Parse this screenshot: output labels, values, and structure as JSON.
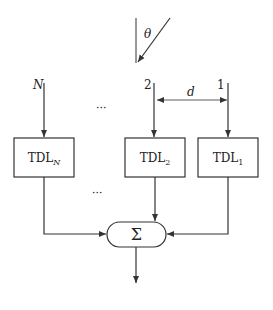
{
  "diagram": {
    "type": "block-diagram",
    "incident": {
      "angle_label": "θ"
    },
    "sensors": [
      {
        "label": "N",
        "block": "TDL",
        "subscript": "N"
      },
      {
        "label": "2",
        "block": "TDL",
        "subscript": "2"
      },
      {
        "label": "1",
        "block": "TDL",
        "subscript": "1"
      }
    ],
    "spacing_label": "d",
    "ellipsis_top": "···",
    "ellipsis_bottom": "···",
    "summer": {
      "symbol": "Σ"
    },
    "output_label": "Output"
  },
  "colors": {
    "stroke": "#333333",
    "background": "#ffffff"
  }
}
